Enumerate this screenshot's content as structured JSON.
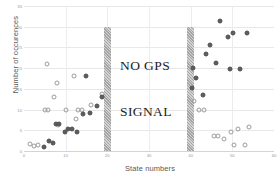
{
  "chart_data": {
    "type": "scatter",
    "title": "",
    "xlabel": "State numbers",
    "ylabel": "Number of occurences",
    "xlim": [
      0,
      60
    ],
    "ylim": [
      0,
      35
    ],
    "xticks": [
      0,
      10,
      20,
      30,
      40,
      50,
      60
    ],
    "yticks": [
      0,
      5,
      10,
      15,
      20,
      25,
      30,
      35
    ],
    "grid": true,
    "legend": "none",
    "annotations": [
      {
        "text": "NO GPS",
        "x": 28,
        "y": 21
      },
      {
        "text": "SIGNAL",
        "x": 28,
        "y": 10
      }
    ],
    "shaded_bands": [
      {
        "name": "no-gps-band-left",
        "x": 20,
        "y_from": 0,
        "y_to": 30,
        "color": "#9d9d9d"
      },
      {
        "name": "no-gps-band-right",
        "x": 40,
        "y_from": 0,
        "y_to": 30,
        "color": "#9d9d9d"
      }
    ],
    "series": [
      {
        "name": "open-circles",
        "marker": "open-circle",
        "color": "#9c9c9c",
        "points": [
          [
            1.5,
            1.6
          ],
          [
            2.3,
            1.2
          ],
          [
            3.4,
            1.5
          ],
          [
            5.0,
            10.0
          ],
          [
            5.8,
            10.0
          ],
          [
            5.6,
            21.0
          ],
          [
            7.2,
            13.0
          ],
          [
            8.0,
            16.5
          ],
          [
            8.2,
            6.2
          ],
          [
            10.1,
            10.0
          ],
          [
            12.0,
            18.0
          ],
          [
            13.0,
            10.0
          ],
          [
            13.9,
            10.0
          ],
          [
            12.4,
            7.8
          ],
          [
            16.1,
            11.2
          ],
          [
            18.6,
            13.8
          ],
          [
            40.8,
            12.0
          ],
          [
            42.0,
            10.0
          ],
          [
            43.2,
            10.0
          ],
          [
            45.6,
            3.6
          ],
          [
            46.6,
            3.6
          ],
          [
            47.9,
            2.9
          ],
          [
            49.6,
            4.6
          ],
          [
            51.4,
            5.4
          ],
          [
            50.4,
            1.4
          ],
          [
            53.1,
            1.4
          ],
          [
            54.0,
            5.8
          ]
        ]
      },
      {
        "name": "filled-circles",
        "marker": "filled-circle",
        "color": "#5e5e5e",
        "points": [
          [
            4.9,
            0.9
          ],
          [
            5.9,
            2.5
          ],
          [
            6.9,
            1.9
          ],
          [
            7.6,
            6.4
          ],
          [
            8.5,
            6.4
          ],
          [
            9.8,
            4.6
          ],
          [
            10.6,
            5.4
          ],
          [
            11.6,
            5.3
          ],
          [
            12.6,
            4.5
          ],
          [
            14.2,
            9.0
          ],
          [
            14.9,
            18.2
          ],
          [
            15.8,
            9.2
          ],
          [
            17.4,
            10.8
          ],
          [
            18.8,
            13.0
          ],
          [
            40.2,
            15.2
          ],
          [
            40.6,
            20.0
          ],
          [
            41.3,
            17.6
          ],
          [
            42.9,
            13.6
          ],
          [
            43.6,
            23.3
          ],
          [
            44.7,
            25.6
          ],
          [
            46.0,
            21.3
          ],
          [
            47.1,
            31.5
          ],
          [
            48.9,
            27.4
          ],
          [
            50.2,
            28.6
          ],
          [
            49.4,
            19.8
          ],
          [
            51.9,
            19.8
          ],
          [
            53.5,
            28.6
          ]
        ]
      }
    ]
  }
}
